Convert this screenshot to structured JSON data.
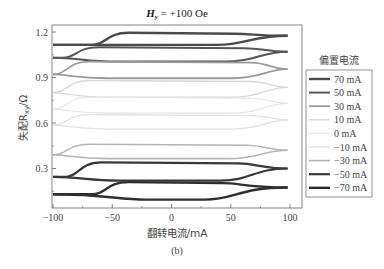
{
  "chart_data": {
    "type": "line",
    "title_main": "H",
    "title_sub": "y",
    "title_rest": " = +100 Oe",
    "xlabel": "翻转电流/mA",
    "ylabel": "失配R_xy/Ω",
    "ylabel_main": "失配R",
    "ylabel_sub": "xy",
    "ylabel_rest": "/Ω",
    "caption": "(b)",
    "xlim": [
      -100,
      100
    ],
    "ylim": [
      0.06,
      1.245
    ],
    "xticks": [
      -100,
      -50,
      0,
      50,
      100
    ],
    "xtick_labels": [
      "−100",
      "−50",
      "0",
      "50",
      "100"
    ],
    "yticks": [
      0.3,
      0.6,
      0.9,
      1.2
    ],
    "ytick_labels": [
      "0.3",
      "0.6",
      "0.9",
      "1.2"
    ],
    "grid": false,
    "legend_title": "偏置电流",
    "legend_position": "right",
    "series": [
      {
        "name": "70 mA",
        "color": "#4a4a4a",
        "width": 2.4,
        "low": 1.115,
        "high": 1.195,
        "left": 1.115,
        "right": 1.175,
        "sw_up": -55,
        "sw_down": 72
      },
      {
        "name": "50 mA",
        "color": "#555555",
        "width": 2.0,
        "low": 1.005,
        "high": 1.1,
        "left": 1.03,
        "right": 1.07,
        "sw_up": -80,
        "sw_down": 80
      },
      {
        "name": "30 mA",
        "color": "#9a9a9a",
        "width": 1.8,
        "low": 0.895,
        "high": 1.005,
        "left": 0.92,
        "right": 0.955,
        "sw_up": -88,
        "sw_down": 85
      },
      {
        "name": "10 mA",
        "color": "#d8d8d8",
        "width": 1.4,
        "low": 0.77,
        "high": 0.88,
        "left": 0.8,
        "right": 0.835,
        "sw_up": -88,
        "sw_down": 85
      },
      {
        "name": "0 mA",
        "color": "#e6e6e6",
        "width": 1.2,
        "low": 0.665,
        "high": 0.77,
        "left": 0.69,
        "right": 0.73,
        "sw_up": -88,
        "sw_down": 85
      },
      {
        "name": "−10 mA",
        "color": "#e0e0e0",
        "width": 1.2,
        "low": 0.56,
        "high": 0.655,
        "left": 0.585,
        "right": 0.62,
        "sw_up": -88,
        "sw_down": 85
      },
      {
        "name": "−30 mA",
        "color": "#b5b5b5",
        "width": 1.6,
        "low": 0.365,
        "high": 0.46,
        "left": 0.39,
        "right": 0.42,
        "sw_up": -88,
        "sw_down": 82
      },
      {
        "name": "−50 mA",
        "color": "#383838",
        "width": 2.2,
        "low": 0.22,
        "high": 0.34,
        "left": 0.245,
        "right": 0.3,
        "sw_up": -78,
        "sw_down": 75
      },
      {
        "name": "−70 mA",
        "color": "#2e2e2e",
        "width": 2.4,
        "low": 0.095,
        "high": 0.21,
        "left": 0.13,
        "right": 0.175,
        "sw_up": -55,
        "sw_down": 62
      }
    ]
  }
}
